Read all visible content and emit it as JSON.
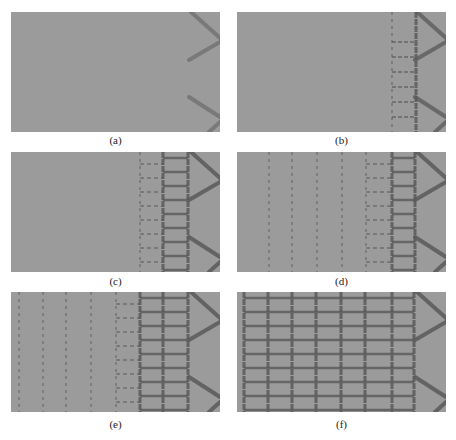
{
  "figure": {
    "background_color": "#9b9b9b",
    "line_color": "#5a5a5a",
    "panels": [
      {
        "id": "a",
        "caption": "(a)",
        "x": 11,
        "y": 12,
        "vlines": [],
        "faint_vlines": [],
        "rungs": [],
        "chevron_strength": 0.6
      },
      {
        "id": "b",
        "caption": "(b)",
        "x": 237,
        "y": 12,
        "vlines": [
          179
        ],
        "faint_vlines": [
          155
        ],
        "rungs": [
          [
            155,
            179,
            30
          ],
          [
            155,
            179,
            45
          ],
          [
            155,
            179,
            60
          ],
          [
            155,
            179,
            75
          ],
          [
            155,
            179,
            90
          ],
          [
            155,
            179,
            105
          ]
        ],
        "chevron_strength": 0.9
      },
      {
        "id": "c",
        "caption": "(c)",
        "x": 11,
        "y": 152,
        "vlines": [
          152,
          177
        ],
        "faint_vlines": [
          129
        ],
        "rungs": "ladder",
        "chevron_strength": 1
      },
      {
        "id": "d",
        "caption": "(d)",
        "x": 237,
        "y": 152,
        "vlines": [
          155,
          178
        ],
        "faint_vlines": [
          32,
          55,
          80,
          105,
          129
        ],
        "rungs": "ladder",
        "chevron_strength": 1
      },
      {
        "id": "e",
        "caption": "(e)",
        "x": 11,
        "y": 292,
        "vlines": [
          129,
          152,
          177
        ],
        "faint_vlines": [
          8,
          32,
          55,
          80,
          105
        ],
        "rungs": "ladder",
        "chevron_strength": 1
      },
      {
        "id": "f",
        "caption": "(f)",
        "x": 237,
        "y": 292,
        "vlines": [
          7,
          31,
          55,
          79,
          104,
          128,
          155,
          177
        ],
        "faint_vlines": [],
        "rungs": "ladder",
        "chevron_strength": 1
      }
    ]
  }
}
